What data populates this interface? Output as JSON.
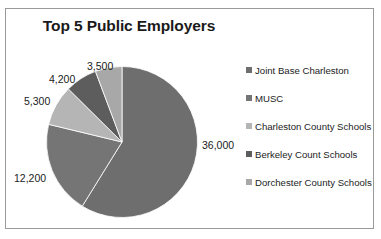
{
  "chart_data": {
    "type": "pie",
    "title": "Top 5 Public Employers",
    "categories": [
      "Joint Base Charleston",
      "MUSC",
      "Charleston County Schools",
      "Berkeley Count Schools",
      "Dorchester County Schools"
    ],
    "values": [
      36000,
      12200,
      5300,
      4200,
      3500
    ],
    "value_labels": [
      "36,000",
      "12,200",
      "5,300",
      "4,200",
      "3,500"
    ],
    "total": 61200,
    "colors": [
      "#6e6e6e",
      "#757575",
      "#b5b5b5",
      "#5d5d5d",
      "#a8a8a8"
    ],
    "legend_position": "right",
    "grid": false,
    "start_angle_deg": 0,
    "direction": "clockwise",
    "xlabel": "",
    "ylabel": ""
  },
  "title": "Top 5 Public Employers",
  "labels": {
    "joint_base_charleston": "36,000",
    "musc": "12,200",
    "charleston_county_schools": "5,300",
    "berkeley_count_schools": "4,200",
    "dorchester_county_schools": "3,500"
  },
  "legend": {
    "items": [
      {
        "label": "Joint Base Charleston",
        "color": "#6e6e6e"
      },
      {
        "label": "MUSC",
        "color": "#757575"
      },
      {
        "label": "Charleston County Schools",
        "color": "#b5b5b5"
      },
      {
        "label": "Berkeley Count Schools",
        "color": "#5d5d5d"
      },
      {
        "label": "Dorchester County Schools",
        "color": "#a8a8a8"
      }
    ]
  },
  "frame": {
    "border_color": "#9a9a9a"
  }
}
